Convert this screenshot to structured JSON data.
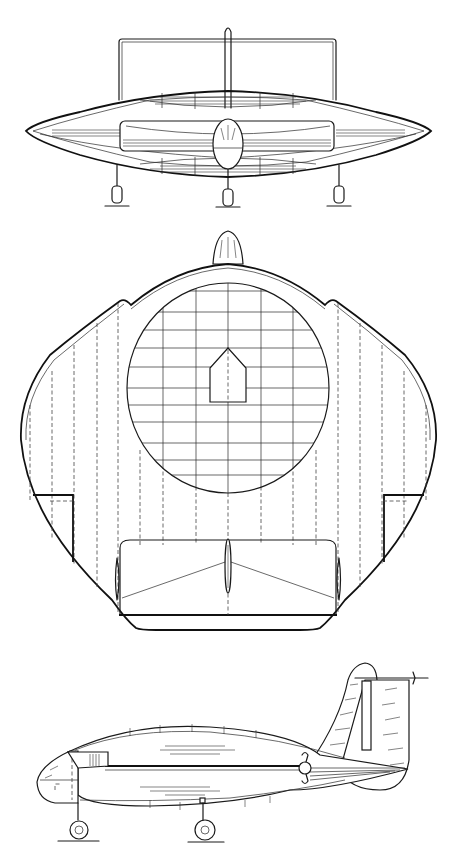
{
  "drawing": {
    "background": "#ffffff",
    "ink_color": "#1a1a1a",
    "views": [
      {
        "id": "front-view",
        "label": "",
        "bounds": {
          "x": 25,
          "y": 25,
          "w": 410,
          "h": 190
        },
        "features": [
          "elliptical disc wing",
          "overhead rectangular frame",
          "vertical fin",
          "central nacelle",
          "three landing gear wheels"
        ]
      },
      {
        "id": "top-view",
        "label": "",
        "bounds": {
          "x": 18,
          "y": 228,
          "w": 422,
          "h": 432
        },
        "features": [
          "rounded diamond planform",
          "circular gridded panel",
          "nose cone",
          "rear tail pod",
          "dashed hidden ribs"
        ]
      },
      {
        "id": "side-view",
        "label": "",
        "bounds": {
          "x": 35,
          "y": 660,
          "w": 395,
          "h": 195
        },
        "features": [
          "cigar fuselage",
          "tall tail fin",
          "propeller",
          "two landing wheels"
        ]
      }
    ],
    "front_gear_x": [
      117,
      228,
      339
    ],
    "top_grid_columns": [
      163,
      196,
      228,
      261,
      293
    ],
    "top_grid_rows": [
      291,
      312,
      330,
      348,
      367,
      388,
      405,
      422,
      443,
      460,
      475
    ],
    "top_hidden_ribs_left": [
      30,
      52,
      74,
      97,
      118,
      140,
      163,
      196
    ],
    "top_hidden_ribs_right": [
      261,
      293,
      316,
      338,
      360,
      382,
      404,
      426
    ],
    "side_wheels": [
      {
        "cx": 79,
        "cy": 830,
        "r": 10
      },
      {
        "cx": 205,
        "cy": 830,
        "r": 10
      }
    ]
  }
}
